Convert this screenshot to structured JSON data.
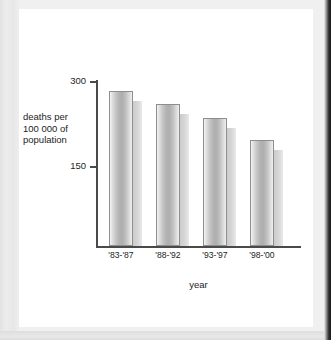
{
  "chart_data": {
    "type": "bar",
    "title": "",
    "xlabel": "year",
    "ylabel": "deaths per 100 000 of population",
    "ylabel_lines": [
      "deaths per",
      "100 000 of",
      "population"
    ],
    "categories": [
      "'83-'87",
      "'88-'92",
      "'93-'97",
      "'98-'00"
    ],
    "values": [
      281,
      258,
      233,
      195
    ],
    "ytick_labels": [
      "300",
      "150"
    ],
    "ytick_values": [
      300,
      150
    ],
    "ylim": [
      0,
      310
    ],
    "grid": false,
    "legend": null,
    "bar_style": "cylindrical-3d-with-right-shadow",
    "colors": {
      "bar_light": "#f4f4f4",
      "bar_mid": "#aeaeae",
      "bar_edge": "#8e8e8e",
      "shadow": "#c9c9c9",
      "axis": "#4a4a4a",
      "text": "#1d1d1d",
      "page": "#ffffff",
      "scan_margin": "#e7e7e7",
      "scan_dark_edge": "#1b1b1b"
    }
  }
}
